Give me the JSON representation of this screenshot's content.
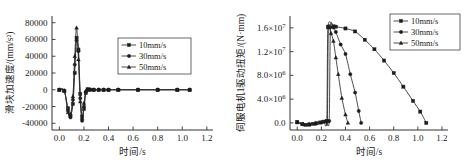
{
  "figure": {
    "panels": [
      {
        "id": "slider-acceleration",
        "ylabel": "滑块加速度/(mm/s²)",
        "xlabel": "时间/s",
        "yticks": [
          "80000",
          "60000",
          "40000",
          "20000",
          "0",
          "-20000",
          "-40000"
        ],
        "xticks": [
          "0.0",
          "0.2",
          "0.4",
          "0.6",
          "0.8",
          "1.0",
          "1.2"
        ],
        "legend": [
          "10mm/s",
          "30mm/s",
          "50mm/s"
        ]
      },
      {
        "id": "servo-motor-torque",
        "ylabel": "伺服电机1驱动扭矩/(N·mm)",
        "xlabel": "时间/s",
        "yticks": [
          "1.6×10⁷",
          "1.2×10⁷",
          "8.0×10⁶",
          "4.0×10⁶",
          "0.0"
        ],
        "xticks": [
          "0.0",
          "0.2",
          "0.4",
          "0.6",
          "0.8",
          "1.0",
          "1.2"
        ],
        "legend": [
          "10mm/s",
          "30mm/s",
          "50mm/s"
        ]
      }
    ]
  },
  "chart_data": [
    {
      "type": "line",
      "title": "",
      "xlabel": "时间/s",
      "ylabel": "滑块加速度/(mm/s²)",
      "xlim": [
        -0.06,
        1.25
      ],
      "ylim": [
        -48000,
        88000
      ],
      "xticks": [
        0.0,
        0.2,
        0.4,
        0.6,
        0.8,
        1.0,
        1.2
      ],
      "yticks": [
        -40000,
        -20000,
        0,
        20000,
        40000,
        60000,
        80000
      ],
      "grid": false,
      "legend_position": "center-right",
      "series": [
        {
          "name": "10mm/s",
          "marker": "square",
          "x": [
            0.0,
            0.04,
            0.07,
            0.09,
            0.11,
            0.125,
            0.14,
            0.155,
            0.17,
            0.185,
            0.2,
            0.215,
            0.23,
            0.25,
            0.28,
            0.32,
            0.36,
            0.4,
            0.48,
            0.64,
            0.8,
            0.96,
            1.06
          ],
          "y": [
            0,
            -1500,
            -22000,
            -31000,
            -17000,
            20000,
            62000,
            48000,
            -5000,
            -32000,
            -23000,
            -4000,
            500,
            200,
            0,
            0,
            0,
            0,
            0,
            0,
            0,
            0,
            0
          ]
        },
        {
          "name": "30mm/s",
          "marker": "circle",
          "x": [
            0.0,
            0.04,
            0.07,
            0.09,
            0.11,
            0.125,
            0.14,
            0.155,
            0.17,
            0.185,
            0.2,
            0.215,
            0.23,
            0.25,
            0.28,
            0.32,
            0.36,
            0.4,
            0.48,
            0.64,
            0.8,
            0.96,
            1.06
          ],
          "y": [
            0,
            -1200,
            -25000,
            -33000,
            -12000,
            30000,
            59000,
            46000,
            -10000,
            -37000,
            -20000,
            -2500,
            300,
            100,
            0,
            0,
            0,
            0,
            0,
            0,
            0,
            0,
            0
          ]
        },
        {
          "name": "50mm/s",
          "marker": "triangle",
          "x": [
            0.0,
            0.04,
            0.07,
            0.09,
            0.11,
            0.125,
            0.14,
            0.155,
            0.17,
            0.185,
            0.2,
            0.215,
            0.23,
            0.25,
            0.28,
            0.32,
            0.36,
            0.4,
            0.48,
            0.64,
            0.8,
            0.96,
            1.06
          ],
          "y": [
            0,
            -1000,
            -27000,
            -29000,
            -8000,
            40000,
            74000,
            36000,
            -14000,
            -34000,
            -16000,
            -1500,
            200,
            100,
            0,
            0,
            0,
            0,
            0,
            0,
            0,
            0,
            0
          ]
        }
      ]
    },
    {
      "type": "line",
      "title": "",
      "xlabel": "时间/s",
      "ylabel": "伺服电机1驱动扭矩/(N·mm)",
      "xlim": [
        -0.06,
        1.25
      ],
      "ylim": [
        -1200000,
        18000000
      ],
      "xticks": [
        0.0,
        0.2,
        0.4,
        0.6,
        0.8,
        1.0,
        1.2
      ],
      "yticks": [
        0,
        4000000,
        8000000,
        12000000,
        16000000
      ],
      "grid": false,
      "legend_position": "top-right",
      "series": [
        {
          "name": "10mm/s",
          "marker": "square",
          "x": [
            0.0,
            0.04,
            0.07,
            0.1,
            0.13,
            0.16,
            0.19,
            0.22,
            0.245,
            0.255,
            0.3,
            0.32,
            0.4,
            0.48,
            0.56,
            0.64,
            0.72,
            0.8,
            0.88,
            0.96,
            1.02,
            1.07
          ],
          "y": [
            120000,
            -180000,
            -330000,
            -280000,
            -160000,
            -60000,
            60000,
            210000,
            300000,
            16200000,
            16250000,
            16200000,
            15900000,
            15400000,
            14000000,
            12400000,
            10500000,
            8400000,
            6100000,
            3700000,
            1900000,
            0
          ]
        },
        {
          "name": "30mm/s",
          "marker": "circle",
          "x": [
            0.0,
            0.05,
            0.1,
            0.15,
            0.2,
            0.24,
            0.265,
            0.275,
            0.3,
            0.32,
            0.36,
            0.4,
            0.44,
            0.48,
            0.51,
            0.53
          ],
          "y": [
            100000,
            -250000,
            -260000,
            -140000,
            80000,
            260000,
            320000,
            16100000,
            16050000,
            15300000,
            13200000,
            11600000,
            8200000,
            5100000,
            2000000,
            0
          ]
        },
        {
          "name": "50mm/s",
          "marker": "triangle",
          "x": [
            0.0,
            0.05,
            0.1,
            0.15,
            0.2,
            0.235,
            0.25,
            0.258,
            0.28,
            0.3,
            0.32,
            0.34,
            0.37,
            0.4,
            0.42
          ],
          "y": [
            90000,
            -220000,
            -240000,
            -120000,
            90000,
            280000,
            330000,
            16050000,
            15100000,
            13800000,
            11000000,
            8200000,
            4200000,
            1400000,
            0
          ]
        }
      ]
    }
  ]
}
